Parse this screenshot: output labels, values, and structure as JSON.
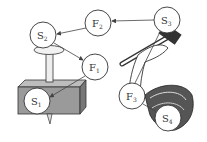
{
  "diagram": {
    "nodes": [
      {
        "id": "S2",
        "base": "S",
        "sub": "2",
        "cx": 43,
        "cy": 35
      },
      {
        "id": "F2",
        "base": "F",
        "sub": "2",
        "cx": 98,
        "cy": 23
      },
      {
        "id": "S3",
        "base": "S",
        "sub": "3",
        "cx": 167,
        "cy": 20
      },
      {
        "id": "F1",
        "base": "F",
        "sub": "1",
        "cx": 95,
        "cy": 67
      },
      {
        "id": "S1",
        "base": "S",
        "sub": "1",
        "cx": 37,
        "cy": 101
      },
      {
        "id": "F3",
        "base": "F",
        "sub": "3",
        "cx": 132,
        "cy": 96
      },
      {
        "id": "S4",
        "base": "S",
        "sub": "4",
        "cx": 168,
        "cy": 118
      }
    ],
    "arrows": [
      {
        "from": "S3",
        "to": "F2"
      },
      {
        "from": "F2",
        "to": "S2"
      },
      {
        "from": "S2",
        "to": "F1"
      },
      {
        "from": "F1",
        "to": "S1"
      }
    ],
    "lines": [
      {
        "from": "F3",
        "to": "S3"
      },
      {
        "from": "F3",
        "to": "S4"
      }
    ],
    "illustrations": [
      "nail-in-block",
      "hand-holding-hammer"
    ]
  }
}
